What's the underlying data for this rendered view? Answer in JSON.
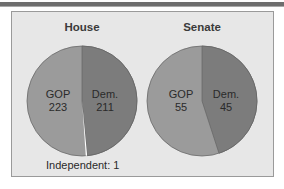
{
  "chart_data": [
    {
      "type": "pie",
      "title": "House",
      "categories": [
        "GOP",
        "Dem.",
        "Independent"
      ],
      "values": [
        223,
        211,
        1
      ],
      "labels": [
        "GOP\n223",
        "Dem.\n211",
        "Independent: 1"
      ],
      "colors": [
        "#9b9b9b",
        "#7c7c7c",
        "#ffffff"
      ]
    },
    {
      "type": "pie",
      "title": "Senate",
      "categories": [
        "GOP",
        "Dem."
      ],
      "values": [
        55,
        45
      ],
      "labels": [
        "GOP\n55",
        "Dem.\n45"
      ],
      "colors": [
        "#9b9b9b",
        "#7c7c7c"
      ]
    }
  ],
  "house": {
    "title": "House",
    "gop_label": "GOP",
    "gop_value": "223",
    "dem_label": "Dem.",
    "dem_value": "211",
    "independent_label": "Independent: 1"
  },
  "senate": {
    "title": "Senate",
    "gop_label": "GOP",
    "gop_value": "55",
    "dem_label": "Dem.",
    "dem_value": "45"
  },
  "colors": {
    "gop": "#9b9b9b",
    "dem": "#7c7c7c",
    "independent": "#ffffff",
    "panel": "#e7e7e7",
    "border": "#9a9a9a"
  }
}
